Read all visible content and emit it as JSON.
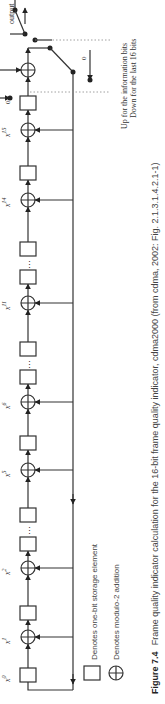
{
  "figure": {
    "label": "Figure 7.4",
    "caption": "Frame quality indicator calculation for the 16-bit frame quality indicator, cdma2000 (from cdma, 2002: Fig. 2.1.3.1.4.2.1-1)"
  },
  "diagram": {
    "tap_labels": [
      "x",
      "x",
      "x",
      "x",
      "x",
      "x",
      "x",
      "x"
    ],
    "tap_exponents": [
      "0",
      "1",
      "2",
      "5",
      "6",
      "11",
      "14",
      "15"
    ],
    "input_label": "Input",
    "output_label": "output",
    "zero_label_top": "0",
    "zero_label_bottom": "0",
    "switch_note_line1": "Up for the information bits",
    "switch_note_line2": "Down for the last 16 bits",
    "ellipsis": "⋮"
  },
  "legend": {
    "storage": "Denotes one-bit storage element",
    "adder": "Denotes modulo-2 addition"
  }
}
